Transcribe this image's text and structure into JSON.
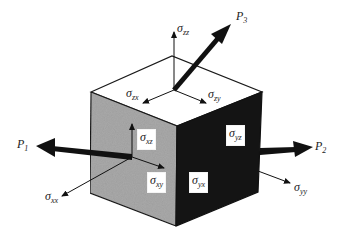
{
  "diagram": {
    "colors": {
      "top_face": "#ffffff",
      "left_face": "#a9a9a9",
      "right_face": "#141414",
      "edges": "#1a1a1a",
      "arrows": "#111111"
    },
    "loads": [
      {
        "id": "P1",
        "symbol": "P",
        "sub": "1"
      },
      {
        "id": "P2",
        "symbol": "P",
        "sub": "2"
      },
      {
        "id": "P3",
        "symbol": "P",
        "sub": "3"
      }
    ],
    "stresses": [
      {
        "id": "szz",
        "symbol": "σ",
        "sub": "zz"
      },
      {
        "id": "szx",
        "symbol": "σ",
        "sub": "zx"
      },
      {
        "id": "szy",
        "symbol": "σ",
        "sub": "zy"
      },
      {
        "id": "sxz",
        "symbol": "σ",
        "sub": "xz"
      },
      {
        "id": "sxy",
        "symbol": "σ",
        "sub": "xy"
      },
      {
        "id": "sxx",
        "symbol": "σ",
        "sub": "xx"
      },
      {
        "id": "syz",
        "symbol": "σ",
        "sub": "yz"
      },
      {
        "id": "syx",
        "symbol": "σ",
        "sub": "yx"
      },
      {
        "id": "syy",
        "symbol": "σ",
        "sub": "yy"
      }
    ]
  }
}
